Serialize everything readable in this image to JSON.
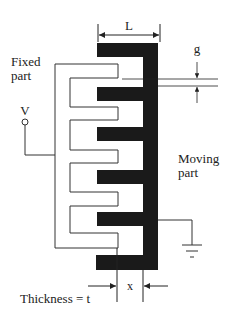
{
  "diagram": {
    "labels": {
      "length": "L",
      "gap": "g",
      "fixed_line1": "Fixed",
      "fixed_line2": "part",
      "voltage": "V",
      "moving_line1": "Moving",
      "moving_line2": "part",
      "overlap": "x",
      "thickness": "Thickness = t"
    },
    "colors": {
      "moving_fill": "#1a1a1a",
      "fixed_stroke": "#333333",
      "background": "#ffffff"
    },
    "moving_part": {
      "finger_count": 6,
      "fingers_y": [
        43,
        87,
        127,
        170,
        212,
        255
      ],
      "finger_height": 14,
      "finger_left_x": 97,
      "spine_x": [
        143,
        158
      ],
      "spine_y": [
        43,
        270
      ]
    },
    "fixed_part": {
      "finger_count": 5,
      "fingers_y": [
        64,
        107,
        150,
        192,
        233
      ],
      "finger_height": 14,
      "finger_right_x": 118,
      "outer_x": 55,
      "inner_x": 70
    }
  }
}
